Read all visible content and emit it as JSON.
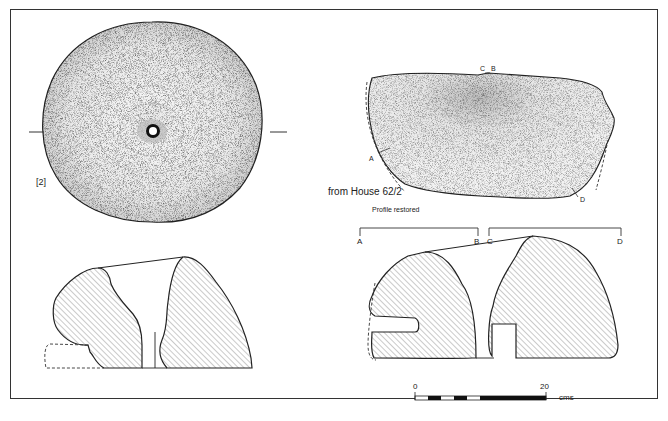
{
  "figure": {
    "item_number": "[2]",
    "provenance": "from House 62/2",
    "note": "Profile restored",
    "section_points": {
      "left": {
        "start": "A",
        "end": "B"
      },
      "right": {
        "start": "C",
        "end": "D"
      }
    },
    "plan_markers": {
      "a": "A",
      "b": "B",
      "c": "C",
      "d": "D"
    },
    "scale_bar": {
      "min": "0",
      "max": "20",
      "unit": "cms",
      "segments": 10
    },
    "colors": {
      "ink": "#222222",
      "hatch": "#555555",
      "stipple": "#3a3a3a",
      "paper": "#ffffff"
    }
  },
  "caption": ""
}
